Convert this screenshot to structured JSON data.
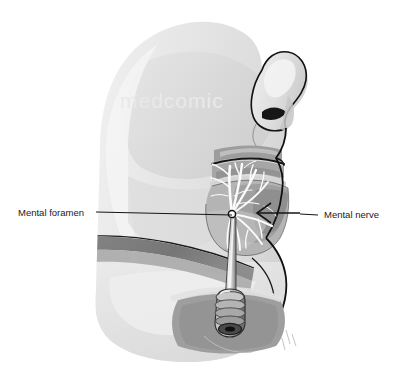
{
  "figure": {
    "width": 399,
    "height": 375,
    "background_color": "#ffffff",
    "watermark": "medcomic"
  },
  "labels": [
    {
      "id": "mental-foramen",
      "text": "Mental foramen",
      "text_x": 18,
      "text_y": 213,
      "anchor": "start",
      "leader": "M 96 212 L 232 215"
    },
    {
      "id": "mental-nerve",
      "text": "Mental nerve",
      "text_x": 324,
      "text_y": 215,
      "anchor": "start",
      "leader": "M 318 215 L 255 214"
    }
  ],
  "annotations": {
    "arrow_label": "nerve-direction-arrow",
    "arrow_path": "M 300 213 L 257 213",
    "arrow_head": "M 271 204 L 257 213 L 271 222",
    "foramen_point": {
      "cx": 232,
      "cy": 214,
      "r": 3.4
    }
  },
  "palette": {
    "skin_light": "#ececec",
    "skin_mid": "#dcdcdc",
    "skin_shade": "#cfcfcf",
    "skin_deep": "#c2c2c2",
    "tissue_gray": "#b0b0b0",
    "muscle_gray": "#9a9a9a",
    "muscle_dark": "#848484",
    "cut_band": "#7c7c7c",
    "outline": "#111111",
    "nerve_white": "#fbfbfb",
    "needle_body": "#d8d8d8",
    "needle_dark": "#5e5e5e",
    "label_text": "#1a1a1a",
    "background": "#ffffff"
  },
  "anatomy_parts": [
    {
      "id": "forehead-cheek",
      "name": "Forehead and cheek"
    },
    {
      "id": "nose",
      "name": "Nose profile"
    },
    {
      "id": "upper-lip",
      "name": "Upper lip"
    },
    {
      "id": "lower-lip",
      "name": "Lower lip"
    },
    {
      "id": "chin",
      "name": "Chin"
    },
    {
      "id": "mandible",
      "name": "Mandible cutaway"
    },
    {
      "id": "neck-shadow",
      "name": "Neck shadow"
    },
    {
      "id": "mental-nerve-branches",
      "name": "Mental nerve branches"
    },
    {
      "id": "needle",
      "name": "Injection needle"
    },
    {
      "id": "needle-hub",
      "name": "Needle hub"
    }
  ]
}
